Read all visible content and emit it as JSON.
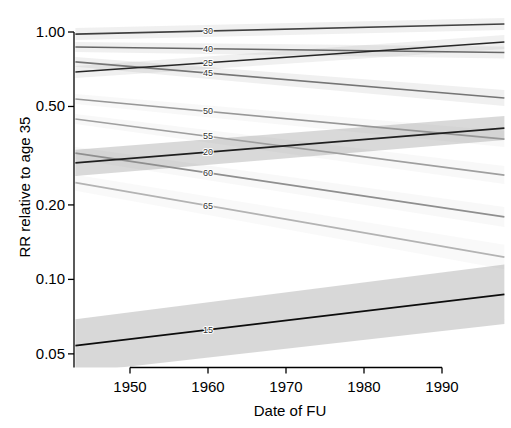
{
  "figure": {
    "background": "#ffffff",
    "axis_color": "#000000",
    "band_color": "#828282",
    "line_label_color": "#333333"
  },
  "chart_data": {
    "type": "line",
    "title": "",
    "xlabel": "Date of FU",
    "ylabel": "RR relative to age 35",
    "reference_age": 35,
    "y_scale": "log",
    "x_domain": [
      1943,
      1998
    ],
    "x_ticks": [
      1950,
      1960,
      1970,
      1980,
      1990
    ],
    "y_ticks": [
      1.0,
      0.5,
      0.2,
      0.1,
      0.05
    ],
    "y_tick_labels": [
      "1.00",
      "0.50",
      "0.20",
      "0.10",
      "0.05"
    ],
    "label_x": 1960,
    "legend": "curve labels are attained age; shaded regions are confidence bands",
    "x": [
      1943,
      1998
    ],
    "series": [
      {
        "age": 65,
        "label": "65",
        "color": "#b3b3b3",
        "band_alpha": 0.05,
        "values": [
          0.246,
          0.123
        ],
        "lower": [
          0.228,
          0.11
        ],
        "upper": [
          0.265,
          0.138
        ]
      },
      {
        "age": 60,
        "label": "60",
        "color": "#8f8f8f",
        "band_alpha": 0.06,
        "values": [
          0.324,
          0.179
        ],
        "lower": [
          0.306,
          0.163
        ],
        "upper": [
          0.343,
          0.196
        ]
      },
      {
        "age": 55,
        "label": "55",
        "color": "#9f9f9f",
        "band_alpha": 0.06,
        "values": [
          0.445,
          0.264
        ],
        "lower": [
          0.425,
          0.243
        ],
        "upper": [
          0.466,
          0.287
        ]
      },
      {
        "age": 50,
        "label": "50",
        "color": "#979797",
        "band_alpha": 0.06,
        "values": [
          0.536,
          0.369
        ],
        "lower": [
          0.512,
          0.343
        ],
        "upper": [
          0.562,
          0.398
        ]
      },
      {
        "age": 45,
        "label": "45",
        "color": "#757575",
        "band_alpha": 0.12,
        "values": [
          0.757,
          0.541
        ],
        "lower": [
          0.723,
          0.502
        ],
        "upper": [
          0.793,
          0.583
        ]
      },
      {
        "age": 40,
        "label": "40",
        "color": "#676767",
        "band_alpha": 0.12,
        "values": [
          0.87,
          0.826
        ],
        "lower": [
          0.83,
          0.781
        ],
        "upper": [
          0.911,
          0.873
        ]
      },
      {
        "age": 30,
        "label": "30",
        "color": "#404040",
        "band_alpha": 0.12,
        "values": [
          0.981,
          1.077
        ],
        "lower": [
          0.928,
          1.019
        ],
        "upper": [
          1.037,
          1.139
        ]
      },
      {
        "age": 25,
        "label": "25",
        "color": "#262626",
        "band_alpha": 0.12,
        "values": [
          0.689,
          0.911
        ],
        "lower": [
          0.652,
          0.854
        ],
        "upper": [
          0.729,
          0.972
        ]
      },
      {
        "age": 20,
        "label": "20",
        "color": "#1f1f1f",
        "band_alpha": 0.3,
        "values": [
          0.296,
          0.409
        ],
        "lower": [
          0.262,
          0.366
        ],
        "upper": [
          0.334,
          0.457
        ]
      },
      {
        "age": 15,
        "label": "15",
        "color": "#0d0d0d",
        "band_alpha": 0.31,
        "values": [
          0.054,
          0.087
        ],
        "lower": [
          0.042,
          0.066
        ],
        "upper": [
          0.069,
          0.115
        ]
      }
    ]
  }
}
